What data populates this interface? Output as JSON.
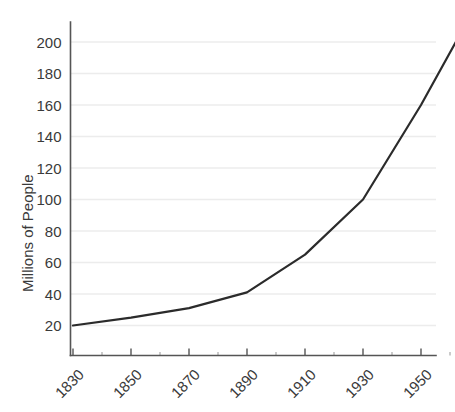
{
  "chart_data": {
    "type": "line",
    "title": "",
    "subtitle": "",
    "xlabel": "",
    "ylabel": "Millions of People",
    "x": [
      1830,
      1850,
      1870,
      1890,
      1910,
      1930,
      1950,
      1962
    ],
    "values": [
      20,
      25,
      31,
      41,
      65,
      100,
      160,
      200
    ],
    "series": [
      {
        "name": "Population",
        "x": [
          1830,
          1850,
          1870,
          1890,
          1910,
          1930,
          1950,
          1962
        ],
        "values": [
          20,
          25,
          31,
          41,
          65,
          100,
          160,
          200
        ]
      }
    ],
    "xlim": [
      1830,
      1965
    ],
    "ylim": [
      0,
      210
    ],
    "y_ticks": [
      20,
      40,
      60,
      80,
      100,
      120,
      140,
      160,
      180,
      200
    ],
    "y_tick_labels": [
      "20",
      "40",
      "60",
      "80",
      "100",
      "120",
      "140",
      "160",
      "180",
      "200"
    ],
    "x_ticks": [
      1830,
      1850,
      1870,
      1890,
      1910,
      1930,
      1950
    ],
    "x_tick_labels": [
      "1830",
      "1850",
      "1870",
      "1890",
      "1910",
      "1930",
      "1950"
    ],
    "x_minor_ticks": [
      1840,
      1860,
      1880,
      1900,
      1920,
      1940,
      1960
    ],
    "x_tick_label_rotation": -45,
    "grid": "horizontal",
    "legend": "none",
    "colors": {
      "line": "#2b2b2b",
      "grid": "#ececec",
      "axis": "#555555",
      "text": "#3a3a3a",
      "background": "#ffffff"
    }
  },
  "axis_titles": {
    "y": "Millions of People"
  }
}
